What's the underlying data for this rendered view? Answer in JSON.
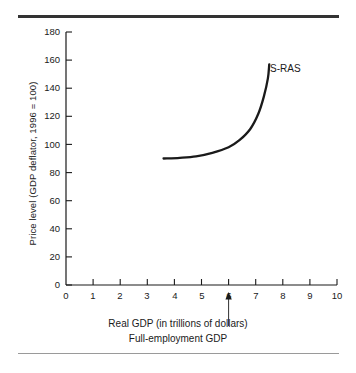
{
  "chart_data": {
    "type": "line",
    "title": "",
    "xlabel": "Real GDP (in trillions of dollars)",
    "ylabel": "Price level (GDP deflator, 1996 = 100)",
    "xlim": [
      0,
      10
    ],
    "ylim": [
      0,
      180
    ],
    "xticks": [
      "0",
      "1",
      "2",
      "3",
      "4",
      "5",
      "6",
      "7",
      "8",
      "9",
      "10"
    ],
    "yticks": [
      "0",
      "20",
      "40",
      "60",
      "80",
      "100",
      "120",
      "140",
      "160",
      "180"
    ],
    "grid": false,
    "legend_position": "inline-right-of-curve",
    "series": [
      {
        "name": "S-RAS",
        "label": "S-RAS",
        "color": "#1a1a1a",
        "points": [
          {
            "x": 3.6,
            "y": 90
          },
          {
            "x": 4.2,
            "y": 90.5
          },
          {
            "x": 4.8,
            "y": 91.5
          },
          {
            "x": 5.4,
            "y": 94
          },
          {
            "x": 6.0,
            "y": 98
          },
          {
            "x": 6.4,
            "y": 103
          },
          {
            "x": 6.8,
            "y": 111
          },
          {
            "x": 7.1,
            "y": 122
          },
          {
            "x": 7.3,
            "y": 134
          },
          {
            "x": 7.45,
            "y": 147
          },
          {
            "x": 7.5,
            "y": 157
          }
        ]
      }
    ],
    "annotations": [
      {
        "name": "full-employment-gdp",
        "label": "Full-employment GDP",
        "x": 6,
        "arrow": "up"
      }
    ]
  },
  "figure": {
    "series_label": "S-RAS",
    "x_axis_title": "Real GDP (in trillions of dollars)",
    "annotation_label": "Full-employment GDP",
    "y_axis_title": "Price level (GDP deflator, 1996 = 100)",
    "colors": {
      "curve": "#1a1a1a",
      "axis": "#1a1a1a",
      "top_rule": "#333333",
      "bottom_rule": "#9a9a9a",
      "text": "#1a1a1a"
    }
  }
}
